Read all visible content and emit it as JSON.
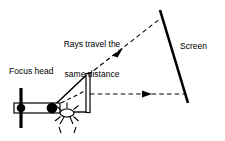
{
  "figure": {
    "type": "optics-ray-diagram",
    "background_color": "#ffffff",
    "stroke_color": "#000000",
    "width": 225,
    "height": 141
  },
  "labels": {
    "rays_note": "Rays travel the\nsame distance",
    "rays_note_line1": "Rays travel the",
    "rays_note_line2": "same distance",
    "screen": "Screen",
    "focus_head": "Focus head"
  },
  "components": {
    "focus_head": {
      "name": "focus head",
      "mount_bar": {
        "x": 21,
        "y1": 88,
        "y2": 128,
        "width": 3
      },
      "body": {
        "x": 14,
        "y": 103,
        "width": 45,
        "height": 10
      },
      "back_node": {
        "cx": 21,
        "cy": 108,
        "r": 4.2
      },
      "front_node": {
        "cx": 52,
        "cy": 108,
        "r": 5.2
      }
    },
    "focal_point": {
      "name": "focal point burst",
      "cx": 67,
      "cy": 113,
      "rx": 7,
      "ry": 4,
      "ray_count": 8
    },
    "detector_bar": {
      "name": "vertical detector bar",
      "x": 86,
      "y": 74,
      "width": 4,
      "height": 38
    },
    "screen": {
      "name": "screen",
      "x1": 160,
      "y1": 10,
      "x2": 188,
      "y2": 103,
      "stroke_width": 2.6
    }
  },
  "rays": {
    "solid_upper_ray": {
      "x1": 52,
      "y1": 108,
      "x2": 88,
      "y2": 73,
      "style": "solid"
    },
    "bottom_edge": {
      "x1": 67,
      "y1": 112,
      "x2": 88,
      "y2": 112,
      "style": "solid"
    },
    "dashed_diagonal_ray": {
      "x1": 88,
      "y1": 75,
      "x2": 161,
      "y2": 18,
      "style": "dashed",
      "arrow_at": [
        120,
        51
      ]
    },
    "dashed_horizontal_ray": {
      "x1": 90,
      "y1": 94,
      "x2": 185,
      "y2": 94,
      "style": "dashed",
      "arrow_at": [
        150,
        94
      ]
    },
    "dashed_short_ray": {
      "x1": 61,
      "y1": 103,
      "x2": 89,
      "y2": 89,
      "style": "dashed"
    }
  }
}
